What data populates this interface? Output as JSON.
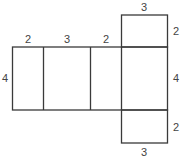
{
  "diagram": {
    "type": "net-of-rectangular-prism",
    "labels": {
      "top_left_width": "2",
      "top_middle_width": "3",
      "top_right_width": "2",
      "left_height": "4",
      "top_flap_width": "3",
      "top_flap_height": "2",
      "right_height": "4",
      "bottom_flap_height": "2",
      "bottom_flap_width": "3"
    },
    "colors": {
      "line": "#3a3a3a",
      "text": "#444444",
      "background": "#ffffff"
    }
  }
}
